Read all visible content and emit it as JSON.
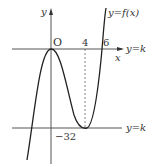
{
  "diagram": {
    "type": "function-graph",
    "axes": {
      "x_label": "x",
      "y_label": "y",
      "origin_label": "O"
    },
    "curve_label": "y=f(x)",
    "x_ticks": [
      "4",
      "6"
    ],
    "y_ticks": [
      "−32"
    ],
    "horizontal_lines": [
      {
        "label": "y=k",
        "y_value": 0
      },
      {
        "label": "y=k",
        "y_value": -32
      }
    ],
    "dashed_guide": {
      "x_value": 4,
      "from_y": 0,
      "to_y": -32
    },
    "features": {
      "local_max": [
        0,
        0
      ],
      "local_min": [
        4,
        -32
      ],
      "root": [
        6,
        0
      ]
    },
    "colors": {
      "curve": "#222222",
      "axes": "#555555",
      "lines": "#555555",
      "text": "#333333"
    }
  }
}
